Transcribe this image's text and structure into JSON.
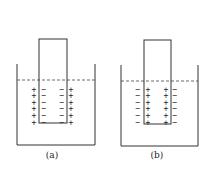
{
  "figures": [
    {
      "id": "a",
      "label": "(a)",
      "beaker": {
        "x1": 17,
        "x2": 95,
        "top": 64,
        "bottom": 145
      },
      "rod": {
        "x": 39,
        "y": 39,
        "w": 28,
        "h": 84
      },
      "water_line_y": 80,
      "columns": [
        {
          "x": 34,
          "symbol": "+"
        },
        {
          "x": 44,
          "symbol": "−"
        },
        {
          "x": 62,
          "symbol": "−"
        },
        {
          "x": 71,
          "symbol": "+"
        }
      ],
      "label_x": 52
    },
    {
      "id": "b",
      "label": "(b)",
      "beaker": {
        "x1": 121,
        "x2": 198,
        "top": 65,
        "bottom": 146
      },
      "rod": {
        "x": 144,
        "y": 40,
        "w": 27,
        "h": 84
      },
      "water_line_y": 81,
      "columns": [
        {
          "x": 138,
          "symbol": "−"
        },
        {
          "x": 148,
          "symbol": "+"
        },
        {
          "x": 166,
          "symbol": "+"
        },
        {
          "x": 175,
          "symbol": "−"
        }
      ],
      "label_x": 157
    }
  ],
  "charge_rows": 6,
  "row_start_y": 89,
  "row_spacing": 6.6,
  "label_y": 158
}
